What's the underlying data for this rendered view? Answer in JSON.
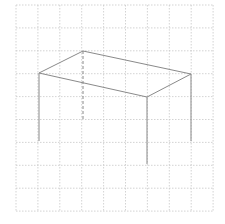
{
  "diagram": {
    "grid": {
      "x0": 16,
      "y0": 5,
      "cols": 9,
      "rows": 9,
      "cell_w": 21.9,
      "cell_h": 22.9,
      "color": "#c8c8c8"
    },
    "figure": {
      "stroke": "#8a8a8a",
      "top_face": [
        [
          39,
          73
        ],
        [
          83,
          51
        ],
        [
          191,
          74
        ],
        [
          147,
          97
        ]
      ],
      "legs_solid": [
        [
          [
            39,
            73
          ],
          [
            39,
            141
          ]
        ],
        [
          [
            147,
            97
          ],
          [
            147,
            164
          ]
        ],
        [
          [
            191,
            74
          ],
          [
            191,
            141
          ]
        ]
      ],
      "legs_hidden": [
        [
          [
            83,
            51
          ],
          [
            83,
            119
          ]
        ]
      ]
    }
  }
}
